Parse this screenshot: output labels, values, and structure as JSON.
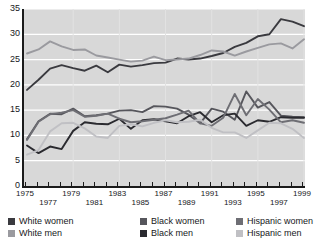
{
  "chart_data": {
    "type": "line",
    "title": "",
    "xlabel": "",
    "ylabel": "",
    "ylim": [
      0,
      35
    ],
    "yticks": [
      0,
      5,
      10,
      15,
      20,
      25,
      30,
      35
    ],
    "grid": true,
    "grid_color": "#ffffff",
    "plot_background": "#d8d8d8",
    "legend_position": "bottom",
    "x": [
      1975,
      1976,
      1977,
      1978,
      1979,
      1980,
      1981,
      1982,
      1983,
      1984,
      1985,
      1986,
      1987,
      1988,
      1989,
      1990,
      1991,
      1992,
      1993,
      1994,
      1995,
      1996,
      1997,
      1998,
      1999
    ],
    "xtick_labels": [
      "1975",
      "1976",
      "1977",
      "1978",
      "1979",
      "1980",
      "1981",
      "1982",
      "1983",
      "1984",
      "1985",
      "1986",
      "1987",
      "1988",
      "1989",
      "1990",
      "1991",
      "1992",
      "1993",
      "1994",
      "1995",
      "1996",
      "1997",
      "1998",
      "1999"
    ],
    "series": [
      {
        "name": "White women",
        "color": "#3a3a3f",
        "values": [
          19.0,
          21.0,
          23.2,
          23.9,
          23.3,
          22.8,
          23.8,
          22.5,
          24.0,
          23.6,
          23.9,
          24.3,
          24.4,
          25.2,
          25.0,
          25.2,
          25.7,
          26.3,
          27.5,
          28.3,
          29.6,
          30.0,
          33.0,
          32.5,
          31.6
        ]
      },
      {
        "name": "White men",
        "color": "#9a9a9f",
        "values": [
          26.2,
          27.0,
          28.6,
          27.6,
          26.9,
          27.0,
          25.8,
          25.4,
          25.0,
          24.6,
          24.8,
          25.6,
          24.9,
          25.0,
          25.2,
          25.9,
          26.8,
          26.6,
          25.8,
          26.6,
          27.3,
          28.0,
          28.2,
          27.2,
          29.0
        ]
      },
      {
        "name": "Black women",
        "color": "#56565c",
        "values": [
          9.3,
          12.8,
          14.3,
          14.2,
          15.3,
          13.8,
          14.0,
          14.3,
          14.9,
          15.0,
          14.6,
          15.8,
          15.7,
          15.3,
          14.1,
          12.4,
          15.3,
          14.7,
          13.1,
          18.7,
          15.5,
          16.6,
          13.9,
          13.7,
          13.6
        ]
      },
      {
        "name": "Black men",
        "color": "#2a2a2f",
        "values": [
          8.0,
          6.5,
          7.8,
          7.3,
          10.9,
          12.6,
          12.3,
          12.2,
          13.3,
          11.3,
          13.0,
          13.2,
          12.8,
          12.4,
          13.8,
          14.6,
          12.6,
          14.0,
          14.3,
          11.9,
          13.0,
          12.7,
          13.6,
          13.5,
          13.5
        ]
      },
      {
        "name": "Hispanic women",
        "color": "#6e6e74",
        "values": [
          9.1,
          12.7,
          14.2,
          14.5,
          15.0,
          13.7,
          13.9,
          14.3,
          13.3,
          12.6,
          12.8,
          13.1,
          13.4,
          14.1,
          14.9,
          12.4,
          11.9,
          13.5,
          18.2,
          14.0,
          17.2,
          15.1,
          12.6,
          13.0,
          12.5
        ]
      },
      {
        "name": "Hispanic men",
        "color": "#c0c0c4",
        "values": [
          6.2,
          7.1,
          10.8,
          12.4,
          12.5,
          11.4,
          9.8,
          9.5,
          11.9,
          12.2,
          11.8,
          12.5,
          13.0,
          12.6,
          12.7,
          13.1,
          11.5,
          10.6,
          10.6,
          9.5,
          11.0,
          12.5,
          12.4,
          11.3,
          9.5
        ]
      }
    ]
  },
  "legend": {
    "items": [
      {
        "label": "White women",
        "color": "#3a3a3f"
      },
      {
        "label": "White men",
        "color": "#9a9a9f"
      },
      {
        "label": "Black women",
        "color": "#56565c"
      },
      {
        "label": "Black men",
        "color": "#2a2a2f"
      },
      {
        "label": "Hispanic women",
        "color": "#6e6e74"
      },
      {
        "label": "Hispanic men",
        "color": "#c0c0c4"
      }
    ]
  }
}
